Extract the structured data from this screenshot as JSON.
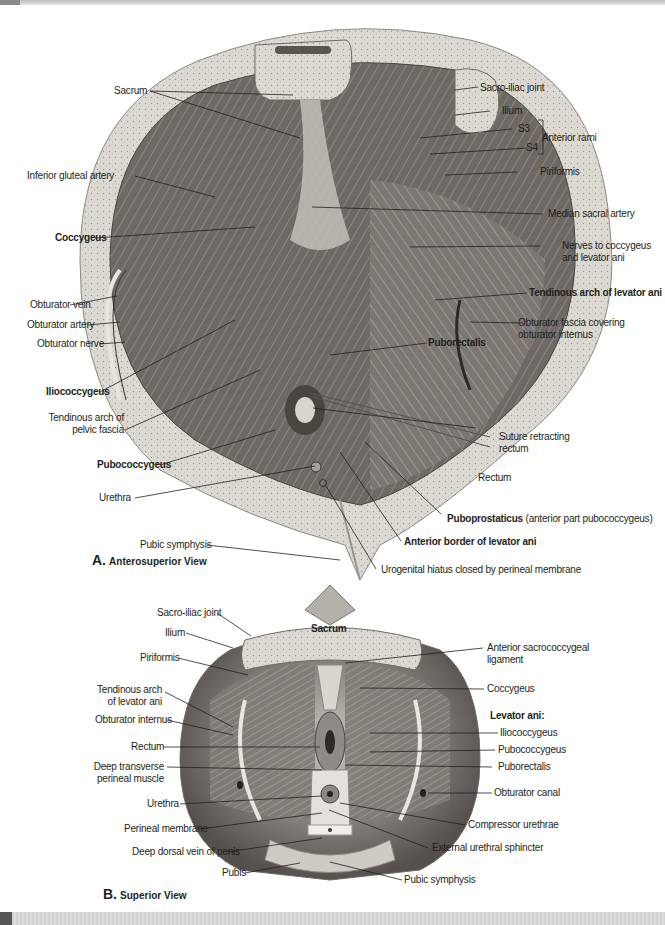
{
  "figure_a": {
    "caption_letter": "A.",
    "caption_text": "Anterosuperior View",
    "labels": {
      "sacrum": "Sacrum",
      "sacro_iliac_joint": "Sacro-iliac joint",
      "ilium": "Ilium",
      "s3": "S3",
      "s4": "S4",
      "anterior_rami": "Anterior rami",
      "piriformis": "Piriformis",
      "inferior_gluteal_artery": "Inferior gluteal artery",
      "median_sacral_artery": "Median sacral artery",
      "coccygeus": "Coccygeus",
      "nerves_line1": "Nerves to coccygeus",
      "nerves_line2": "and levator ani",
      "tendinous_arch_levator_ani": "Tendinous arch of levator ani",
      "obturator_vein": "Obturator vein",
      "obturator_artery": "Obturator artery",
      "obturator_fascia_line1": "Obturator fascia covering",
      "obturator_fascia_line2": "obturator internus",
      "obturator_nerve": "Obturator nerve",
      "puborectalis": "Puborectalis",
      "iliococcygeus": "Iliococcygeus",
      "tendinous_arch_pelvic_line1": "Tendinous arch of",
      "tendinous_arch_pelvic_line2": "pelvic fascia",
      "suture_line1": "Suture retracting",
      "suture_line2": "rectum",
      "pubococcygeus": "Pubococcygeus",
      "rectum": "Rectum",
      "urethra": "Urethra",
      "puboprostaticus_bold": "Puboprostaticus",
      "puboprostaticus_note": "(anterior part pubococcygeus)",
      "pubic_symphysis": "Pubic symphysis",
      "anterior_border": "Anterior border of levator ani",
      "urogenital_hiatus": "Urogenital hiatus closed by perineal membrane"
    }
  },
  "figure_b": {
    "caption_letter": "B.",
    "caption_text": "Superior View",
    "labels": {
      "sacro_iliac_joint": "Sacro-iliac joint",
      "sacrum": "Sacrum",
      "ilium": "Ilium",
      "anterior_sacrococcygeal_line1": "Anterior sacrococcygeal",
      "anterior_sacrococcygeal_line2": "ligament",
      "piriformis": "Piriformis",
      "coccygeus": "Coccygeus",
      "tendinous_arch_line1": "Tendinous arch",
      "tendinous_arch_line2": "of levator ani",
      "levator_ani_heading": "Levator ani:",
      "obturator_internus": "Obturator internus",
      "iliococcygeus": "Iliococcygeus",
      "rectum": "Rectum",
      "pubococcygeus": "Pubococcygeus",
      "deep_transverse_line1": "Deep transverse",
      "deep_transverse_line2": "perineal muscle",
      "puborectalis": "Puborectalis",
      "obturator_canal": "Obturator canal",
      "urethra": "Urethra",
      "compressor_urethrae": "Compressor urethrae",
      "perineal_membrane": "Perineal membrane",
      "external_urethral_sphincter": "External urethral sphincter",
      "deep_dorsal_vein": "Deep dorsal vein of penis",
      "pubis": "Pubis",
      "pubic_symphysis": "Pubic symphysis"
    }
  },
  "colors": {
    "text": "#231f20",
    "bone": "#d9d6cf",
    "muscle_dark": "#5a5552",
    "muscle_mid": "#8d8884",
    "muscle_light": "#bdb8b2",
    "strip": "#d3d3d3"
  }
}
